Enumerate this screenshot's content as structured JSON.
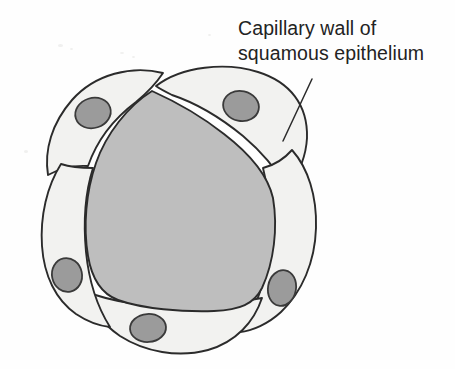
{
  "figure": {
    "domain": "Diagram",
    "width": 455,
    "height": 369,
    "background_color": "#fefefe"
  },
  "label": {
    "name": "capillary-wall-label",
    "line1": "Capillary wall of",
    "line2": "squamous epithelium",
    "full_text": "Capillary wall of squamous epithelium",
    "color": "#232323",
    "font_size_px": 19.5,
    "x": 238,
    "y": 16
  },
  "leader_line": {
    "name": "label-leader-line",
    "from": [
      312,
      79
    ],
    "to": [
      283,
      141
    ],
    "color": "#2b2b2b",
    "width": 1.5
  },
  "colors": {
    "lumen_fill": "#bebebe",
    "cell_fill": "#f2f2f0",
    "nucleus_fill": "#9b9b9b",
    "nucleus_stroke": "#3a3a3a",
    "outline": "#2b2b2b"
  },
  "structures": {
    "lumen": {
      "name": "capillary-lumen",
      "description": "central blood-filled lumen",
      "fill": "#bebebe"
    },
    "cells": [
      {
        "name": "squamous-cell-top-left",
        "position": "top-left"
      },
      {
        "name": "squamous-cell-top-right",
        "position": "top-right"
      },
      {
        "name": "squamous-cell-right",
        "position": "right"
      },
      {
        "name": "squamous-cell-bottom",
        "position": "bottom"
      },
      {
        "name": "squamous-cell-left",
        "position": "left"
      }
    ],
    "nuclei": [
      {
        "name": "nucleus-top-left",
        "cx": 93,
        "cy": 113,
        "rx": 18,
        "ry": 15,
        "rotation": -18
      },
      {
        "name": "nucleus-top-right",
        "cx": 241,
        "cy": 106,
        "rx": 18,
        "ry": 15,
        "rotation": 12
      },
      {
        "name": "nucleus-right",
        "cx": 282,
        "cy": 288,
        "rx": 14,
        "ry": 18,
        "rotation": 10
      },
      {
        "name": "nucleus-bottom",
        "cx": 148,
        "cy": 328,
        "rx": 18,
        "ry": 14,
        "rotation": -4
      },
      {
        "name": "nucleus-left",
        "cx": 67,
        "cy": 275,
        "rx": 15,
        "ry": 17,
        "rotation": -12
      }
    ]
  }
}
